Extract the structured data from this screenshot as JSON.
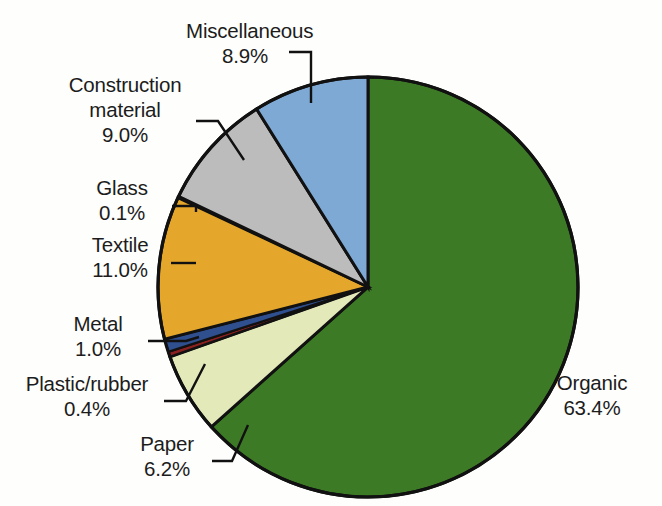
{
  "background_color": "#fefefd",
  "chart_data": {
    "type": "pie",
    "title": "",
    "subtitle": "",
    "xlabel": "",
    "ylabel": "",
    "legend_position": "none",
    "grid": false,
    "units": "percent",
    "start_angle_deg": 0,
    "direction": "clockwise",
    "center": {
      "x": 368,
      "y": 287
    },
    "radius": 210,
    "categories": [
      "Organic",
      "Paper",
      "Plastic/rubber",
      "Metal",
      "Textile",
      "Glass",
      "Construction material",
      "Miscellaneous"
    ],
    "values": [
      63.4,
      6.2,
      0.4,
      1.0,
      11.0,
      0.1,
      9.0,
      8.9
    ],
    "colors": [
      "#3d7a26",
      "#e3e9b9",
      "#8b2020",
      "#2f4f8f",
      "#e5a72b",
      "#efe7d2",
      "#bcbcbc",
      "#7ea9d4"
    ],
    "slice_outline_color": "#111111",
    "slices": [
      {
        "name": "Organic",
        "value": 63.4,
        "label": "Organic",
        "value_label": "63.4%",
        "color": "#3d7a26"
      },
      {
        "name": "Paper",
        "value": 6.2,
        "label": "Paper",
        "value_label": "6.2%",
        "color": "#e3e9b9"
      },
      {
        "name": "Plastic/rubber",
        "value": 0.4,
        "label": "Plastic/rubber",
        "value_label": "0.4%",
        "color": "#8b2020"
      },
      {
        "name": "Metal",
        "value": 1.0,
        "label": "Metal",
        "value_label": "1.0%",
        "color": "#2f4f8f"
      },
      {
        "name": "Textile",
        "value": 11.0,
        "label": "Textile",
        "value_label": "11.0%",
        "color": "#e5a72b"
      },
      {
        "name": "Glass",
        "value": 0.1,
        "label": "Glass",
        "value_label": "0.1%",
        "color": "#efe7d2"
      },
      {
        "name": "Construction material",
        "value": 9.0,
        "label": "Construction material",
        "value_label": "9.0%",
        "color": "#bcbcbc"
      },
      {
        "name": "Miscellaneous",
        "value": 8.9,
        "label": "Miscellaneous",
        "value_label": "8.9%",
        "color": "#7ea9d4"
      }
    ]
  },
  "labels": {
    "miscellaneous": {
      "name": "Miscellaneous",
      "value": "8.9%"
    },
    "construction_material": {
      "name_line1": "Construction",
      "name_line2": "material",
      "value": "9.0%"
    },
    "glass": {
      "name": "Glass",
      "value": "0.1%"
    },
    "textile": {
      "name": "Textile",
      "value": "11.0%"
    },
    "metal": {
      "name": "Metal",
      "value": "1.0%"
    },
    "plastic_rubber": {
      "name": "Plastic/rubber",
      "value": "0.4%"
    },
    "paper": {
      "name": "Paper",
      "value": "6.2%"
    },
    "organic": {
      "name": "Organic",
      "value": "63.4%"
    }
  }
}
